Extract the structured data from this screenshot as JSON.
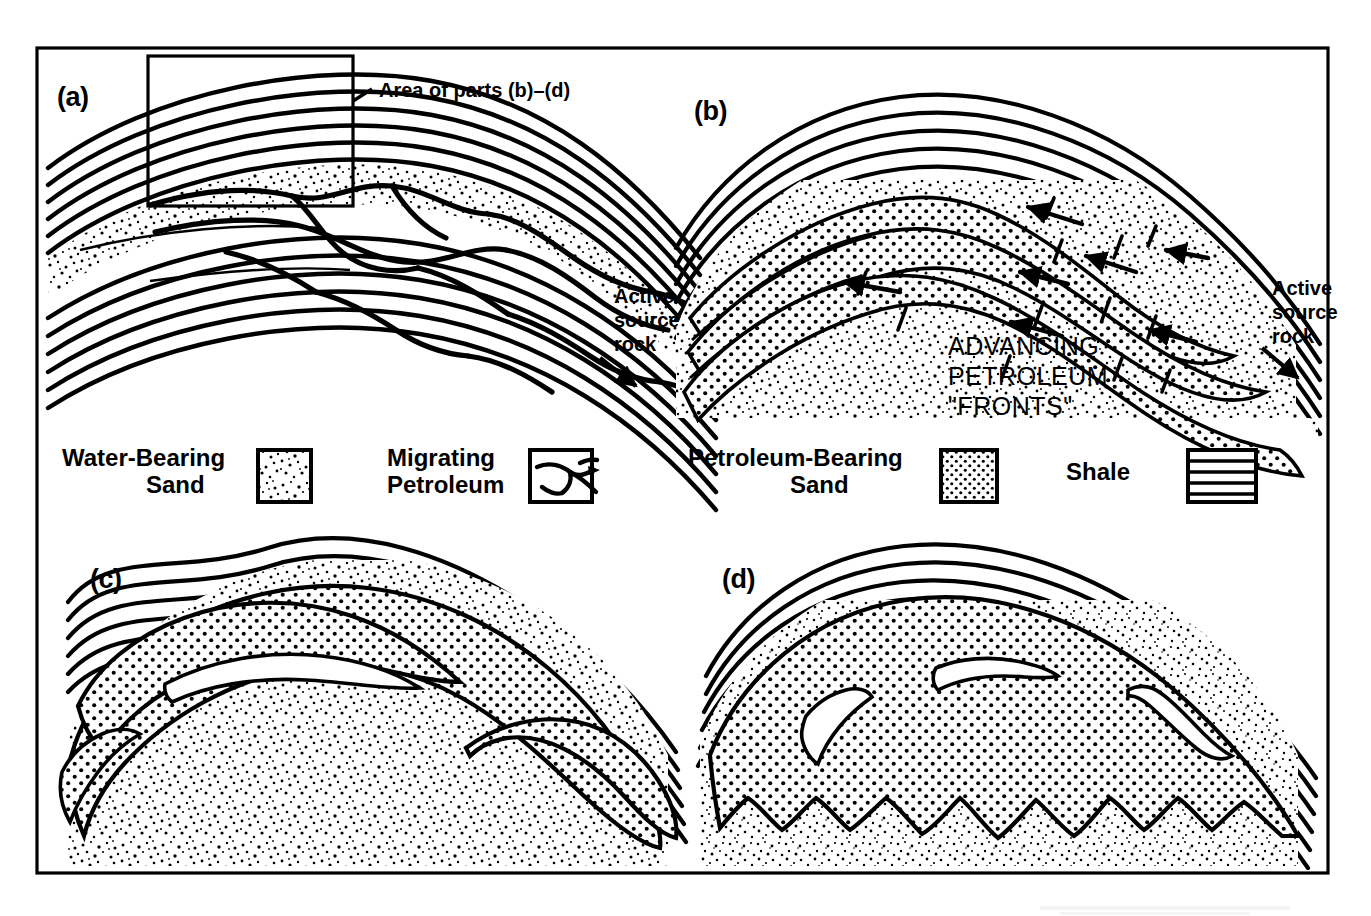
{
  "figure": {
    "domain": "Diagram",
    "frame": {
      "stroke": "#000000",
      "fill": "#ffffff"
    }
  },
  "panels": [
    {
      "id": "a",
      "label": "(a)",
      "description": "Anticline with shale cap and base, water-bearing sand reservoir, and migrating petroleum stringers ascending from the active source rock",
      "annotations": {
        "inset_label": "Area of parts (b)–(d)",
        "source_rock_label": "Active\nsource\nrock"
      }
    },
    {
      "id": "b",
      "label": "(b)",
      "description": "Close-up of the crest showing discrete petroleum-bearing sand stringers advancing updip",
      "annotations": {
        "fronts_label": "ADVANCING\nPETROLEUM\n\"FRONTS\"",
        "source_rock_label": "Active\nsource\nrock"
      }
    },
    {
      "id": "c",
      "label": "(c)",
      "description": "Stringers coalescing into a single petroleum accumulation with finger-like residual water lenses"
    },
    {
      "id": "d",
      "label": "(d)",
      "description": "Mature accumulation filling the crest with an irregular scalloped oil-water contact and isolated residual water lenses"
    }
  ],
  "labels": {
    "panel_a": "(a)",
    "panel_b": "(b)",
    "panel_c": "(c)",
    "panel_d": "(d)",
    "area_of_parts": "Area of parts (b)–(d)",
    "active_line1": "Active",
    "active_line2": "source",
    "active_line3": "rock",
    "advancing_line1": "ADVANCING",
    "advancing_line2": "PETROLEUM",
    "advancing_line3": "\"FRONTS\""
  },
  "legend": {
    "items": [
      {
        "key": "water-bearing-sand",
        "label_line1": "Water-Bearing",
        "label_line2": "Sand",
        "swatch": "irregular-stipple",
        "swatch_description": "Irregular coarse random stipple of black dots on white"
      },
      {
        "key": "migrating-petroleum",
        "label_line1": "Migrating",
        "label_line2": "Petroleum",
        "swatch": "branching-channels",
        "swatch_description": "Dendritic branching black channel network inside a box"
      },
      {
        "key": "petroleum-bearing-sand",
        "label_line1": "Petroleum-Bearing",
        "label_line2": "Sand",
        "swatch": "regular-dot-grid",
        "swatch_description": "Dense regular grid of round black dots"
      },
      {
        "key": "shale",
        "label_line1": "Shale",
        "label_line2": "",
        "swatch": "horizontal-lines",
        "swatch_description": "Evenly spaced horizontal black rules"
      }
    ]
  },
  "colors": {
    "ink": "#000000",
    "paper": "#ffffff",
    "ghost_caption": "#d8d8d8"
  }
}
